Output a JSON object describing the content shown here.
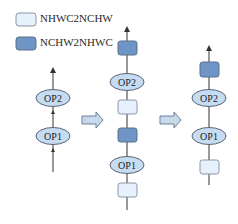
{
  "colors": {
    "light_box_fill": "#e6f1fb",
    "light_box_stroke": "#8a96a6",
    "dark_box_fill": "#6f95c6",
    "dark_box_stroke": "#5d6f88",
    "ellipse_fill": "#c6dcf2",
    "ellipse_stroke": "#5a6576",
    "line": "#333333",
    "arrow_fill": "#c9d9ec",
    "arrow_stroke": "#6e7f96"
  },
  "legend": {
    "items": [
      {
        "label": "NHWC2NCHW",
        "kind": "light"
      },
      {
        "label": "NCHW2NHWC",
        "kind": "dark"
      }
    ]
  },
  "columns": {
    "original": {
      "nodes": [
        "OP2",
        "OP1"
      ]
    },
    "inserted": {
      "nodes_top_to_bottom": [
        "NCHW2NHWC",
        "OP2",
        "NHWC2NCHW",
        "NCHW2NHWC",
        "OP1",
        "NHWC2NCHW"
      ]
    },
    "optimized": {
      "nodes_top_to_bottom": [
        "NCHW2NHWC",
        "OP2",
        "OP1",
        "NHWC2NCHW"
      ]
    }
  },
  "ops": {
    "left_op2": "OP2",
    "left_op1": "OP1",
    "mid_op2": "OP2",
    "mid_op1": "OP1",
    "right_op2": "OP2",
    "right_op1": "OP1"
  }
}
